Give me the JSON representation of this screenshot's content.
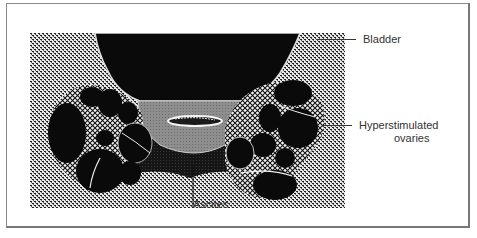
{
  "figure": {
    "type": "ultrasound-schematic",
    "structures": [
      "bladder",
      "ovaries",
      "ascites",
      "uterus"
    ],
    "colors": {
      "bladder": "#0a0a0a",
      "background_tissue_stipple": "#9a9a9a",
      "ovary_follicles": "#0a0a0a",
      "ovary_stroma_crosshatch": "#cfcfcf",
      "uterus": "#8c8c8c",
      "ascites_fluid": "#1a1a1a",
      "outline": "#e8e8e8"
    }
  },
  "labels": {
    "bladder": "Bladder",
    "ovaries_line1": "Hyperstimulated",
    "ovaries_line2": "ovaries",
    "ascites": "Ascites"
  },
  "footer": {
    "cutoff_text": "· · ·  ·  · · ·"
  }
}
